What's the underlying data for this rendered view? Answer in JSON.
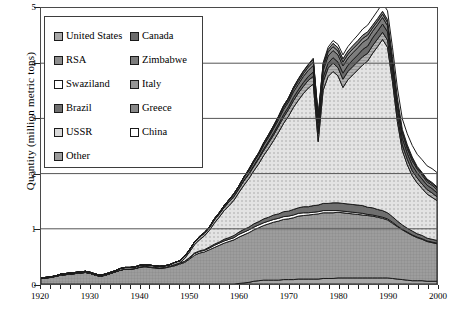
{
  "chart_data": {
    "type": "area",
    "title": "",
    "xlabel": "",
    "ylabel": "Quantity (million metric tons)",
    "xlim": [
      1920,
      2000
    ],
    "ylim": [
      0,
      5
    ],
    "ytick_labels": [
      "0",
      "1",
      "2",
      "3",
      "4",
      "5"
    ],
    "xtick_labels": [
      "1920",
      "1930",
      "1940",
      "1950",
      "1960",
      "1970",
      "1980",
      "1990",
      "2000"
    ],
    "grid": "horizontal",
    "stacked": true,
    "legend_position": "upper-left-inside",
    "x": [
      1920,
      1921,
      1922,
      1923,
      1924,
      1925,
      1926,
      1927,
      1928,
      1929,
      1930,
      1931,
      1932,
      1933,
      1934,
      1935,
      1936,
      1937,
      1938,
      1939,
      1940,
      1941,
      1942,
      1943,
      1944,
      1945,
      1946,
      1947,
      1948,
      1949,
      1950,
      1951,
      1952,
      1953,
      1954,
      1955,
      1956,
      1957,
      1958,
      1959,
      1960,
      1961,
      1962,
      1963,
      1964,
      1965,
      1966,
      1967,
      1968,
      1969,
      1970,
      1971,
      1972,
      1973,
      1974,
      1975,
      1976,
      1977,
      1978,
      1979,
      1980,
      1981,
      1982,
      1983,
      1984,
      1985,
      1986,
      1987,
      1988,
      1989,
      1990,
      1991,
      1992,
      1993,
      1994,
      1995,
      1996,
      1997,
      1998,
      1999,
      2000
    ],
    "series": [
      {
        "name": "United States",
        "color": "#a8a8a8",
        "values": [
          0.0,
          0.0,
          0.0,
          0.0,
          0.0,
          0.0,
          0.0,
          0.0,
          0.0,
          0.0,
          0.0,
          0.0,
          0.0,
          0.0,
          0.0,
          0.0,
          0.0,
          0.0,
          0.0,
          0.0,
          0.0,
          0.0,
          0.0,
          0.0,
          0.0,
          0.0,
          0.0,
          0.0,
          0.0,
          0.0,
          0.0,
          0.0,
          0.0,
          0.0,
          0.0,
          0.0,
          0.0,
          0.0,
          0.0,
          0.0,
          0.01,
          0.02,
          0.03,
          0.05,
          0.06,
          0.07,
          0.07,
          0.07,
          0.07,
          0.08,
          0.08,
          0.08,
          0.09,
          0.09,
          0.09,
          0.09,
          0.09,
          0.1,
          0.1,
          0.1,
          0.11,
          0.11,
          0.11,
          0.11,
          0.11,
          0.11,
          0.11,
          0.11,
          0.11,
          0.11,
          0.11,
          0.1,
          0.09,
          0.08,
          0.07,
          0.06,
          0.06,
          0.06,
          0.05,
          0.05,
          0.05
        ]
      },
      {
        "name": "RSA",
        "color": "#8e8e8e",
        "values": [
          0.1,
          0.11,
          0.12,
          0.14,
          0.16,
          0.17,
          0.18,
          0.19,
          0.2,
          0.21,
          0.19,
          0.16,
          0.14,
          0.16,
          0.19,
          0.22,
          0.25,
          0.27,
          0.27,
          0.28,
          0.3,
          0.31,
          0.3,
          0.29,
          0.28,
          0.29,
          0.31,
          0.33,
          0.36,
          0.39,
          0.45,
          0.52,
          0.56,
          0.58,
          0.62,
          0.66,
          0.7,
          0.74,
          0.77,
          0.8,
          0.84,
          0.87,
          0.9,
          0.93,
          0.96,
          0.99,
          1.02,
          1.05,
          1.07,
          1.09,
          1.1,
          1.12,
          1.14,
          1.15,
          1.16,
          1.17,
          1.18,
          1.19,
          1.19,
          1.19,
          1.19,
          1.18,
          1.17,
          1.16,
          1.15,
          1.14,
          1.13,
          1.12,
          1.1,
          1.08,
          1.05,
          1.0,
          0.95,
          0.9,
          0.86,
          0.82,
          0.78,
          0.75,
          0.72,
          0.7,
          0.68
        ]
      },
      {
        "name": "Swaziland",
        "color": "#ffffff",
        "values": [
          0.0,
          0.0,
          0.0,
          0.0,
          0.0,
          0.0,
          0.0,
          0.0,
          0.0,
          0.0,
          0.0,
          0.0,
          0.0,
          0.0,
          0.0,
          0.0,
          0.0,
          0.0,
          0.0,
          0.0,
          0.01,
          0.01,
          0.01,
          0.01,
          0.01,
          0.01,
          0.01,
          0.02,
          0.02,
          0.02,
          0.02,
          0.03,
          0.03,
          0.03,
          0.03,
          0.04,
          0.04,
          0.04,
          0.04,
          0.04,
          0.05,
          0.05,
          0.05,
          0.05,
          0.05,
          0.05,
          0.05,
          0.05,
          0.05,
          0.05,
          0.05,
          0.05,
          0.05,
          0.05,
          0.04,
          0.04,
          0.04,
          0.04,
          0.04,
          0.04,
          0.03,
          0.03,
          0.03,
          0.03,
          0.03,
          0.03,
          0.02,
          0.02,
          0.02,
          0.02,
          0.02,
          0.02,
          0.01,
          0.01,
          0.01,
          0.01,
          0.01,
          0.01,
          0.01,
          0.01,
          0.01
        ]
      },
      {
        "name": "Brazil",
        "color": "#6f6f6f",
        "values": [
          0.0,
          0.0,
          0.0,
          0.0,
          0.0,
          0.0,
          0.0,
          0.0,
          0.0,
          0.0,
          0.0,
          0.0,
          0.0,
          0.0,
          0.0,
          0.0,
          0.0,
          0.0,
          0.0,
          0.0,
          0.0,
          0.0,
          0.0,
          0.0,
          0.0,
          0.0,
          0.0,
          0.0,
          0.0,
          0.0,
          0.01,
          0.01,
          0.01,
          0.01,
          0.02,
          0.02,
          0.02,
          0.03,
          0.03,
          0.04,
          0.04,
          0.05,
          0.05,
          0.06,
          0.06,
          0.07,
          0.07,
          0.08,
          0.08,
          0.09,
          0.09,
          0.1,
          0.1,
          0.11,
          0.11,
          0.12,
          0.12,
          0.13,
          0.13,
          0.14,
          0.14,
          0.14,
          0.14,
          0.14,
          0.14,
          0.14,
          0.13,
          0.13,
          0.12,
          0.12,
          0.11,
          0.1,
          0.09,
          0.08,
          0.07,
          0.07,
          0.06,
          0.06,
          0.05,
          0.05,
          0.05
        ]
      },
      {
        "name": "USSR",
        "color": "#d9d9d9",
        "values": [
          0.0,
          0.0,
          0.0,
          0.0,
          0.0,
          0.0,
          0.0,
          0.0,
          0.0,
          0.0,
          0.0,
          0.0,
          0.0,
          0.0,
          0.0,
          0.0,
          0.0,
          0.0,
          0.0,
          0.0,
          0.0,
          0.0,
          0.0,
          0.0,
          0.0,
          0.0,
          0.0,
          0.0,
          0.0,
          0.05,
          0.1,
          0.15,
          0.2,
          0.25,
          0.3,
          0.38,
          0.45,
          0.52,
          0.58,
          0.64,
          0.72,
          0.8,
          0.88,
          0.96,
          1.05,
          1.15,
          1.25,
          1.35,
          1.48,
          1.6,
          1.72,
          1.85,
          1.95,
          2.05,
          2.15,
          2.2,
          1.15,
          2.05,
          2.3,
          2.38,
          2.3,
          2.1,
          2.25,
          2.35,
          2.45,
          2.55,
          2.65,
          2.8,
          2.95,
          3.1,
          3.0,
          2.45,
          1.8,
          1.35,
          1.15,
          1.0,
          0.92,
          0.85,
          0.8,
          0.76,
          0.72
        ]
      },
      {
        "name": "Other",
        "color": "#9c9c9c",
        "values": [
          0.01,
          0.01,
          0.01,
          0.01,
          0.02,
          0.02,
          0.02,
          0.02,
          0.02,
          0.02,
          0.02,
          0.02,
          0.02,
          0.02,
          0.02,
          0.02,
          0.03,
          0.03,
          0.03,
          0.03,
          0.03,
          0.03,
          0.03,
          0.03,
          0.03,
          0.03,
          0.03,
          0.04,
          0.04,
          0.04,
          0.04,
          0.05,
          0.05,
          0.05,
          0.05,
          0.06,
          0.06,
          0.06,
          0.07,
          0.07,
          0.07,
          0.08,
          0.08,
          0.08,
          0.09,
          0.09,
          0.1,
          0.1,
          0.11,
          0.11,
          0.12,
          0.12,
          0.13,
          0.13,
          0.14,
          0.14,
          0.14,
          0.15,
          0.15,
          0.15,
          0.15,
          0.15,
          0.15,
          0.15,
          0.15,
          0.15,
          0.14,
          0.14,
          0.14,
          0.13,
          0.13,
          0.12,
          0.11,
          0.1,
          0.1,
          0.09,
          0.09,
          0.08,
          0.08,
          0.08,
          0.07
        ]
      },
      {
        "name": "Canada",
        "color": "#6b6b6b",
        "values": [
          0.0,
          0.0,
          0.0,
          0.0,
          0.0,
          0.0,
          0.0,
          0.0,
          0.0,
          0.0,
          0.0,
          0.0,
          0.0,
          0.0,
          0.0,
          0.0,
          0.0,
          0.0,
          0.0,
          0.0,
          0.0,
          0.0,
          0.0,
          0.0,
          0.0,
          0.0,
          0.0,
          0.0,
          0.0,
          0.0,
          0.0,
          0.0,
          0.0,
          0.0,
          0.0,
          0.0,
          0.0,
          0.0,
          0.0,
          0.0,
          0.0,
          0.01,
          0.01,
          0.02,
          0.02,
          0.03,
          0.03,
          0.04,
          0.04,
          0.05,
          0.05,
          0.06,
          0.06,
          0.07,
          0.07,
          0.08,
          0.08,
          0.09,
          0.09,
          0.1,
          0.1,
          0.11,
          0.11,
          0.12,
          0.12,
          0.13,
          0.13,
          0.14,
          0.14,
          0.15,
          0.15,
          0.14,
          0.13,
          0.12,
          0.11,
          0.1,
          0.09,
          0.09,
          0.08,
          0.08,
          0.07
        ]
      },
      {
        "name": "Zimbabwe",
        "color": "#7d7d7d",
        "values": [
          0.0,
          0.0,
          0.0,
          0.0,
          0.0,
          0.0,
          0.0,
          0.0,
          0.0,
          0.0,
          0.0,
          0.0,
          0.0,
          0.0,
          0.0,
          0.0,
          0.0,
          0.0,
          0.0,
          0.0,
          0.0,
          0.0,
          0.0,
          0.0,
          0.0,
          0.0,
          0.0,
          0.0,
          0.0,
          0.0,
          0.0,
          0.0,
          0.01,
          0.01,
          0.01,
          0.02,
          0.02,
          0.03,
          0.03,
          0.04,
          0.04,
          0.05,
          0.05,
          0.06,
          0.06,
          0.07,
          0.07,
          0.08,
          0.08,
          0.09,
          0.09,
          0.1,
          0.1,
          0.11,
          0.11,
          0.12,
          0.12,
          0.12,
          0.13,
          0.13,
          0.13,
          0.13,
          0.13,
          0.13,
          0.13,
          0.13,
          0.13,
          0.12,
          0.12,
          0.12,
          0.11,
          0.1,
          0.1,
          0.09,
          0.08,
          0.08,
          0.07,
          0.07,
          0.06,
          0.06,
          0.06
        ]
      },
      {
        "name": "Italy",
        "color": "#959595",
        "values": [
          0.0,
          0.0,
          0.0,
          0.0,
          0.0,
          0.0,
          0.0,
          0.0,
          0.0,
          0.0,
          0.0,
          0.0,
          0.0,
          0.0,
          0.0,
          0.0,
          0.0,
          0.0,
          0.0,
          0.0,
          0.0,
          0.0,
          0.0,
          0.0,
          0.0,
          0.0,
          0.0,
          0.0,
          0.0,
          0.0,
          0.0,
          0.0,
          0.0,
          0.0,
          0.0,
          0.0,
          0.0,
          0.0,
          0.01,
          0.01,
          0.01,
          0.01,
          0.02,
          0.02,
          0.02,
          0.03,
          0.03,
          0.03,
          0.04,
          0.04,
          0.04,
          0.05,
          0.05,
          0.05,
          0.06,
          0.06,
          0.06,
          0.06,
          0.07,
          0.07,
          0.07,
          0.07,
          0.07,
          0.07,
          0.07,
          0.07,
          0.07,
          0.06,
          0.06,
          0.06,
          0.06,
          0.05,
          0.05,
          0.04,
          0.04,
          0.04,
          0.03,
          0.03,
          0.03,
          0.03,
          0.03
        ]
      },
      {
        "name": "Greece",
        "color": "#888888",
        "values": [
          0.0,
          0.0,
          0.0,
          0.0,
          0.0,
          0.0,
          0.0,
          0.0,
          0.0,
          0.0,
          0.0,
          0.0,
          0.0,
          0.0,
          0.0,
          0.0,
          0.0,
          0.0,
          0.0,
          0.0,
          0.0,
          0.0,
          0.0,
          0.0,
          0.0,
          0.0,
          0.0,
          0.0,
          0.0,
          0.0,
          0.0,
          0.0,
          0.0,
          0.0,
          0.0,
          0.0,
          0.0,
          0.0,
          0.0,
          0.0,
          0.0,
          0.0,
          0.01,
          0.01,
          0.01,
          0.01,
          0.02,
          0.02,
          0.02,
          0.03,
          0.03,
          0.03,
          0.04,
          0.04,
          0.04,
          0.05,
          0.05,
          0.05,
          0.05,
          0.06,
          0.06,
          0.06,
          0.06,
          0.06,
          0.06,
          0.06,
          0.06,
          0.05,
          0.05,
          0.05,
          0.05,
          0.04,
          0.04,
          0.03,
          0.03,
          0.03,
          0.02,
          0.02,
          0.02,
          0.02,
          0.02
        ]
      },
      {
        "name": "China",
        "color": "#ffffff",
        "values": [
          0.0,
          0.0,
          0.0,
          0.0,
          0.0,
          0.0,
          0.0,
          0.0,
          0.0,
          0.0,
          0.0,
          0.0,
          0.0,
          0.0,
          0.0,
          0.0,
          0.0,
          0.0,
          0.0,
          0.0,
          0.0,
          0.0,
          0.0,
          0.0,
          0.0,
          0.0,
          0.0,
          0.0,
          0.0,
          0.0,
          0.0,
          0.0,
          0.0,
          0.0,
          0.0,
          0.0,
          0.0,
          0.0,
          0.0,
          0.0,
          0.0,
          0.0,
          0.0,
          0.0,
          0.0,
          0.0,
          0.0,
          0.0,
          0.0,
          0.0,
          0.0,
          0.0,
          0.01,
          0.01,
          0.01,
          0.02,
          0.02,
          0.03,
          0.04,
          0.05,
          0.06,
          0.07,
          0.08,
          0.09,
          0.1,
          0.11,
          0.12,
          0.13,
          0.14,
          0.15,
          0.16,
          0.17,
          0.18,
          0.19,
          0.2,
          0.21,
          0.22,
          0.23,
          0.24,
          0.25,
          0.26
        ]
      }
    ]
  },
  "legend": {
    "column1": [
      {
        "label": "United States",
        "swatch": "#a8a8a8"
      },
      {
        "label": "RSA",
        "swatch": "#8e8e8e"
      },
      {
        "label": "Swaziland",
        "swatch": "#ffffff"
      },
      {
        "label": "Brazil",
        "swatch": "#6f6f6f"
      },
      {
        "label": "USSR",
        "swatch": "#d9d9d9"
      },
      {
        "label": "Other",
        "swatch": "#9c9c9c"
      }
    ],
    "column2": [
      {
        "label": "Canada",
        "swatch": "#6b6b6b"
      },
      {
        "label": "Zimbabwe",
        "swatch": "#7d7d7d"
      },
      {
        "label": "Italy",
        "swatch": "#959595"
      },
      {
        "label": "Greece",
        "swatch": "#888888"
      },
      {
        "label": "China",
        "swatch": "#ffffff"
      }
    ]
  }
}
